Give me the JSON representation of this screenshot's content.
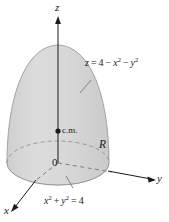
{
  "figure": {
    "background_color": "#ffffff",
    "solid_fill_color": "#d6d6d6",
    "solid_fill_color_light": "#e2e2e2",
    "outline_color": "#8c8c8c",
    "axis_color": "#1a1a1a",
    "dash_color": "#8c8c8c",
    "width": 169,
    "height": 222
  },
  "axes": {
    "z_label": "z",
    "y_label": "y",
    "x_label": "x",
    "origin_label": "0"
  },
  "labels": {
    "surface_equation": {
      "z": "z",
      "equals": "=",
      "four": "4",
      "minus1": "−",
      "x": "x",
      "exp2a": "2",
      "minus2": "−",
      "y": "y",
      "exp2b": "2",
      "full_text": "z = 4 − x² − y²"
    },
    "base_equation": {
      "x": "x",
      "exp2a": "2",
      "plus": "+",
      "y": "y",
      "exp2b": "2",
      "equals": "=",
      "four": "4",
      "full_text": "x² + y² = 4"
    },
    "center_of_mass": "c.m.",
    "region": "R"
  }
}
